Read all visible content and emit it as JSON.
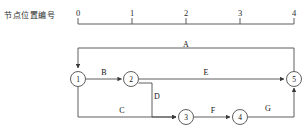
{
  "axis": {
    "caption": "节点位置编号",
    "ticks": [
      {
        "label": "0",
        "x": 78
      },
      {
        "label": "1",
        "x": 132
      },
      {
        "label": "2",
        "x": 186
      },
      {
        "label": "3",
        "x": 240
      },
      {
        "label": "4",
        "x": 294
      }
    ],
    "line": {
      "x1": 78,
      "x2": 294,
      "y": 24
    },
    "tick_height": 6,
    "label_y": 8
  },
  "colors": {
    "line": "#4d4d4d",
    "node_stroke": "#4d4d4d",
    "text": "#111111",
    "background": "#ffffff"
  },
  "diagram": {
    "type": "activity-on-arrow network",
    "nodes": [
      {
        "id": "1",
        "label": "1",
        "x": 78,
        "y": 79,
        "r": 7.5
      },
      {
        "id": "2",
        "label": "2",
        "x": 131,
        "y": 79,
        "r": 7.5
      },
      {
        "id": "3",
        "label": "3",
        "x": 186,
        "y": 117,
        "r": 7.5
      },
      {
        "id": "4",
        "label": "4",
        "x": 240,
        "y": 117,
        "r": 7.5
      },
      {
        "id": "5",
        "label": "5",
        "x": 294,
        "y": 79,
        "r": 7.5
      }
    ],
    "activities": [
      {
        "name": "A",
        "from": "5",
        "to": "1",
        "label_x": 186,
        "label_y": 44
      },
      {
        "name": "B",
        "from": "1",
        "to": "2",
        "label_x": 104,
        "label_y": 72
      },
      {
        "name": "C",
        "from": "1",
        "to": "3",
        "label_x": 122,
        "label_y": 110
      },
      {
        "name": "D",
        "from": "2",
        "to": "3",
        "label_x": 157,
        "label_y": 96
      },
      {
        "name": "E",
        "from": "2",
        "to": "5",
        "label_x": 206,
        "label_y": 72
      },
      {
        "name": "F",
        "from": "3",
        "to": "4",
        "label_x": 213,
        "label_y": 110
      },
      {
        "name": "G",
        "from": "4",
        "to": "5",
        "label_x": 268,
        "label_y": 108
      }
    ]
  }
}
